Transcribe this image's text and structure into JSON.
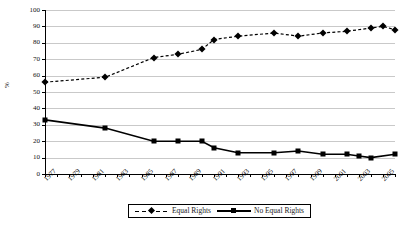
{
  "chart_data": {
    "type": "line",
    "title": "",
    "xlabel": "",
    "ylabel": "%",
    "ylim": [
      0,
      100
    ],
    "ytick_values": [
      0,
      10,
      20,
      30,
      40,
      50,
      60,
      70,
      80,
      90,
      100
    ],
    "xlim": [
      1977,
      2006
    ],
    "grid": true,
    "legend_position": "bottom-center",
    "xtick_labels": [
      "1977",
      "1979",
      "1981",
      "1983",
      "1985",
      "1987",
      "1989",
      "1991",
      "1993",
      "1995",
      "1997",
      "1999",
      "2001",
      "2003",
      "2005"
    ],
    "series": [
      {
        "name": "Equal Rights",
        "style": "dashed",
        "marker": "diamond",
        "color": "#000000",
        "points": [
          {
            "x": 1977,
            "y": 56
          },
          {
            "x": 1982,
            "y": 59
          },
          {
            "x": 1986,
            "y": 71
          },
          {
            "x": 1988,
            "y": 73
          },
          {
            "x": 1990,
            "y": 76
          },
          {
            "x": 1991,
            "y": 82
          },
          {
            "x": 1993,
            "y": 84
          },
          {
            "x": 1996,
            "y": 86
          },
          {
            "x": 1998,
            "y": 84
          },
          {
            "x": 2000,
            "y": 86
          },
          {
            "x": 2002,
            "y": 87
          },
          {
            "x": 2004,
            "y": 89
          },
          {
            "x": 2005,
            "y": 90
          },
          {
            "x": 2006,
            "y": 88
          }
        ]
      },
      {
        "name": "No Equal Rights",
        "style": "solid",
        "marker": "square",
        "color": "#000000",
        "points": [
          {
            "x": 1977,
            "y": 33
          },
          {
            "x": 1982,
            "y": 28
          },
          {
            "x": 1986,
            "y": 20
          },
          {
            "x": 1988,
            "y": 20
          },
          {
            "x": 1990,
            "y": 20
          },
          {
            "x": 1991,
            "y": 16
          },
          {
            "x": 1993,
            "y": 13
          },
          {
            "x": 1996,
            "y": 13
          },
          {
            "x": 1998,
            "y": 14
          },
          {
            "x": 2000,
            "y": 12
          },
          {
            "x": 2002,
            "y": 12
          },
          {
            "x": 2003,
            "y": 11
          },
          {
            "x": 2004,
            "y": 10
          },
          {
            "x": 2006,
            "y": 12
          }
        ]
      }
    ]
  },
  "legend": {
    "items": [
      {
        "label": "Equal Rights"
      },
      {
        "label": "No Equal Rights"
      }
    ]
  }
}
